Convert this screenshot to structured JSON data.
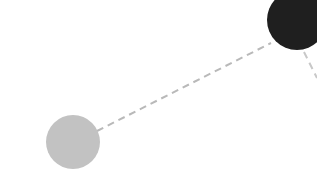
{
  "canvas": {
    "width": 317,
    "height": 195,
    "background_color": "#ffffff",
    "title": "Node Link Diagram"
  },
  "palette": {
    "node_light_fill": "#c2c2c2",
    "node_dark_fill": "#1f1f1f",
    "edge_color": "#b9b9b9",
    "background": "#ffffff"
  },
  "nodes": [
    {
      "id": "node-light",
      "label": "",
      "cx": 73,
      "cy": 142,
      "r": 27,
      "fill": "#c2c2c2",
      "stroke": "none",
      "clipped": false
    },
    {
      "id": "node-dark",
      "label": "",
      "cx": 297,
      "cy": 20,
      "r": 30,
      "fill": "#1f1f1f",
      "stroke": "none",
      "clipped": true
    }
  ],
  "edges": [
    {
      "id": "edge-light-to-dark",
      "from": "node-light",
      "to": "node-dark",
      "x1": 97,
      "y1": 131,
      "x2": 271,
      "y2": 43,
      "color": "#b9b9b9",
      "width": 2,
      "dash": "7 5",
      "style": "dashed"
    },
    {
      "id": "edge-dark-stub",
      "from": "node-dark",
      "to": "",
      "x1": 304,
      "y1": 52,
      "x2": 317,
      "y2": 78,
      "color": "#c8c8c8",
      "width": 2,
      "dash": "7 5",
      "style": "dashed"
    }
  ]
}
